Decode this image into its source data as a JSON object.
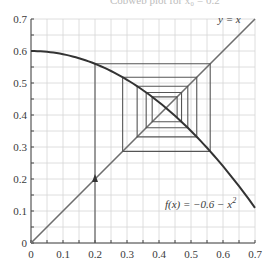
{
  "top_fragment": "Cobweb plot for x₀ = 0.2",
  "chart_data": {
    "type": "line",
    "title": "",
    "xlabel": "",
    "ylabel": "",
    "xlim": [
      0,
      0.7
    ],
    "ylim": [
      0,
      0.7
    ],
    "x_ticks": [
      "0",
      "0.1",
      "0.2",
      "0.3",
      "0.4",
      "0.5",
      "0.6",
      "0.7"
    ],
    "y_ticks": [
      "0",
      "0.1",
      "0.2",
      "0.3",
      "0.4",
      "0.5",
      "0.6",
      "0.7"
    ],
    "grid": true,
    "minor_grid_step": 0.05,
    "series": [
      {
        "name": "y = x",
        "kind": "identity-line",
        "x": [
          0,
          0.7
        ],
        "y": [
          0,
          0.7
        ],
        "color": "#6e6e6e"
      },
      {
        "name": "f(x) = 0.6 − x²",
        "kind": "curve",
        "x": [
          0,
          0.1,
          0.2,
          0.3,
          0.4,
          0.5,
          0.6,
          0.7
        ],
        "y": [
          0.6,
          0.59,
          0.56,
          0.51,
          0.44,
          0.35,
          0.24,
          0.11
        ],
        "color": "#333333"
      },
      {
        "name": "cobweb",
        "kind": "cobweb",
        "x0": 0.2,
        "iterations": 9,
        "color": "#555555"
      }
    ],
    "annotations": [
      {
        "text": "y = x",
        "x": 0.63,
        "y": 0.66
      },
      {
        "text": "f(x) = −0.6 − x²",
        "x": 0.45,
        "y": 0.12
      },
      {
        "text": "arrow-up at x = 0.2",
        "x": 0.2,
        "y": 0.2
      }
    ]
  },
  "labels": {
    "identity": "y = x",
    "function_prefix": "f(x) = −0.6 − x",
    "function_exp": "2"
  }
}
